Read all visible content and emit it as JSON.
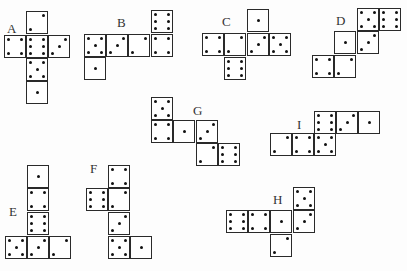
{
  "colors": {
    "line": "#2a2a2a",
    "pip": "#111111",
    "background": "#fdfdfd"
  },
  "nets": [
    {
      "label": "A",
      "label_pos": [
        7,
        22
      ],
      "faces": [
        {
          "x": 26,
          "y": 11,
          "value": 2
        },
        {
          "x": 4,
          "y": 35,
          "value": 4
        },
        {
          "x": 26,
          "y": 35,
          "value": 6
        },
        {
          "x": 48,
          "y": 35,
          "value": 3
        },
        {
          "x": 26,
          "y": 58,
          "value": 5
        },
        {
          "x": 26,
          "y": 81,
          "value": 1
        }
      ]
    },
    {
      "label": "B",
      "label_pos": [
        117,
        16
      ],
      "faces": [
        {
          "x": 151,
          "y": 10,
          "value": 6
        },
        {
          "x": 84,
          "y": 34,
          "value": 5
        },
        {
          "x": 106,
          "y": 34,
          "value": 3
        },
        {
          "x": 128,
          "y": 34,
          "value": 2
        },
        {
          "x": 151,
          "y": 34,
          "value": 4
        },
        {
          "x": 84,
          "y": 57,
          "value": 1
        }
      ]
    },
    {
      "label": "C",
      "label_pos": [
        222,
        15
      ],
      "faces": [
        {
          "x": 247,
          "y": 9,
          "value": 1
        },
        {
          "x": 202,
          "y": 33,
          "value": 4
        },
        {
          "x": 224,
          "y": 33,
          "value": 2
        },
        {
          "x": 247,
          "y": 33,
          "value": 3
        },
        {
          "x": 269,
          "y": 33,
          "value": 5
        },
        {
          "x": 224,
          "y": 57,
          "value": 6
        }
      ]
    },
    {
      "label": "D",
      "label_pos": [
        336,
        14
      ],
      "faces": [
        {
          "x": 357,
          "y": 8,
          "value": 5
        },
        {
          "x": 379,
          "y": 8,
          "value": 6
        },
        {
          "x": 334,
          "y": 31,
          "value": 1
        },
        {
          "x": 357,
          "y": 31,
          "value": 3
        },
        {
          "x": 312,
          "y": 55,
          "value": 4
        },
        {
          "x": 334,
          "y": 55,
          "value": 2
        }
      ]
    },
    {
      "label": "G",
      "label_pos": [
        193,
        104
      ],
      "faces": [
        {
          "x": 151,
          "y": 97,
          "value": 5
        },
        {
          "x": 151,
          "y": 120,
          "value": 4
        },
        {
          "x": 173,
          "y": 120,
          "value": 1
        },
        {
          "x": 196,
          "y": 120,
          "value": 3
        },
        {
          "x": 196,
          "y": 143,
          "value": 2
        },
        {
          "x": 218,
          "y": 143,
          "value": 6
        }
      ]
    },
    {
      "label": "I",
      "label_pos": [
        297,
        118
      ],
      "faces": [
        {
          "x": 314,
          "y": 111,
          "value": 6
        },
        {
          "x": 336,
          "y": 111,
          "value": 3
        },
        {
          "x": 358,
          "y": 111,
          "value": 1
        },
        {
          "x": 270,
          "y": 133,
          "value": 2
        },
        {
          "x": 292,
          "y": 133,
          "value": 4
        },
        {
          "x": 314,
          "y": 133,
          "value": 5
        }
      ]
    },
    {
      "label": "E",
      "label_pos": [
        9,
        205
      ],
      "faces": [
        {
          "x": 27,
          "y": 165,
          "value": 1
        },
        {
          "x": 27,
          "y": 188,
          "value": 4
        },
        {
          "x": 27,
          "y": 212,
          "value": 6
        },
        {
          "x": 5,
          "y": 236,
          "value": 5
        },
        {
          "x": 27,
          "y": 236,
          "value": 3
        },
        {
          "x": 49,
          "y": 236,
          "value": 2
        }
      ]
    },
    {
      "label": "F",
      "label_pos": [
        90,
        162
      ],
      "faces": [
        {
          "x": 108,
          "y": 165,
          "value": 4
        },
        {
          "x": 86,
          "y": 188,
          "value": 6
        },
        {
          "x": 108,
          "y": 188,
          "value": 2
        },
        {
          "x": 108,
          "y": 212,
          "value": 3
        },
        {
          "x": 108,
          "y": 236,
          "value": 5
        },
        {
          "x": 130,
          "y": 236,
          "value": 1
        }
      ]
    },
    {
      "label": "H",
      "label_pos": [
        273,
        193
      ],
      "faces": [
        {
          "x": 293,
          "y": 187,
          "value": 5
        },
        {
          "x": 226,
          "y": 210,
          "value": 6
        },
        {
          "x": 248,
          "y": 210,
          "value": 4
        },
        {
          "x": 270,
          "y": 210,
          "value": 1
        },
        {
          "x": 293,
          "y": 210,
          "value": 3
        },
        {
          "x": 270,
          "y": 234,
          "value": 2
        }
      ]
    }
  ]
}
